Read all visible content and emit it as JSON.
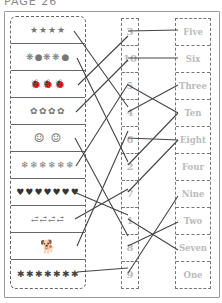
{
  "title": "PAGE 26",
  "pictures": [
    {
      "name": "stars",
      "glyph": "★★★★",
      "color": "#aaa"
    },
    {
      "name": "flowers-balloons",
      "glyph": "❋●❋❋●",
      "color": "#aaa"
    },
    {
      "name": "ladybugs",
      "glyph": "🐞🐞🐞",
      "color": "#333"
    },
    {
      "name": "flowers",
      "glyph": "✿✿✿✿",
      "color": "#999"
    },
    {
      "name": "smiley-faces",
      "glyph": "☺ ☺",
      "color": "#999"
    },
    {
      "name": "snowflakes",
      "glyph": "❄❄❄❄❄❄",
      "color": "#999"
    },
    {
      "name": "hearts",
      "glyph": "♥♥♥♥♥♥♥",
      "color": "#333"
    },
    {
      "name": "carrots",
      "glyph": "⥄⥄⥄⥄",
      "color": "#666"
    },
    {
      "name": "dog",
      "glyph": "🐕",
      "color": "#777"
    },
    {
      "name": "asterisks",
      "glyph": "✱✱✱✱✱✱✱",
      "color": "#444"
    }
  ],
  "numbers": [
    "3",
    "10",
    "5",
    "4",
    "6",
    "2",
    "7",
    "1",
    "8",
    "9"
  ],
  "words": [
    "Five",
    "Six",
    "Three",
    "Ten",
    "Eight",
    "Four",
    "Nine",
    "Two",
    "Seven",
    "One"
  ]
}
